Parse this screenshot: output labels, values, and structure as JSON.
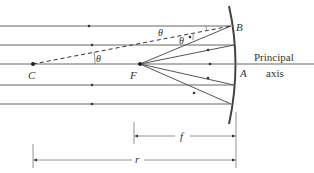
{
  "diagram": {
    "points": {
      "C": "C",
      "F": "F",
      "A": "A",
      "B": "B"
    },
    "axis_label_line1": "Principal",
    "axis_label_line2": "axis",
    "angle_label": "θ",
    "dimension_f": "f",
    "dimension_r": "r",
    "colors": {
      "line": "#555555",
      "dark": "#333333",
      "mirror": "#444444"
    }
  }
}
